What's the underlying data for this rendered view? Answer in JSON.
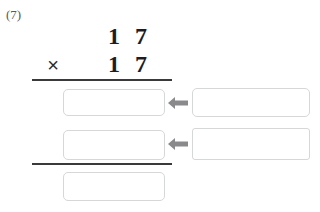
{
  "problem": {
    "number_label": "(7)",
    "multiplicand": "17",
    "multiplier": "17",
    "multiplicand_tens": "1",
    "multiplicand_ones": "7",
    "multiplier_tens": "1",
    "multiplier_ones": "7",
    "operator": "×"
  },
  "answer_boxes": {
    "partial_product_1": "",
    "partial_product_2": "",
    "total": "",
    "hint_1": "",
    "hint_2": ""
  },
  "arrows": {
    "arrow_1_direction": "left",
    "arrow_2_direction": "left",
    "color": "#8a8a8d"
  },
  "colors": {
    "page_background": "#ffffff",
    "digit": "#1d1d1f",
    "problem_number": "#58595b",
    "rule": "#3a3a3c",
    "box_border": "#d6d7d9",
    "arrow": "#8a8a8d"
  },
  "icons": {
    "arrow_left": "arrow-left-icon"
  }
}
